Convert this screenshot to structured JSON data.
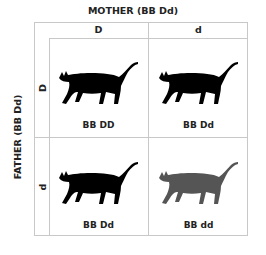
{
  "mother_label": "MOTHER (BB Dd)",
  "father_label": "FATHER (BB Dd)",
  "columns": [
    "D",
    "d"
  ],
  "rows": [
    "D",
    "d"
  ],
  "colors": {
    "dark_cat": "#000000",
    "dilute_cat": "#555555",
    "grid": "#c8c8c8"
  },
  "cells": [
    {
      "genotype": "BB DD",
      "phenotype_icon": "black-cat-icon"
    },
    {
      "genotype": "BB Dd",
      "phenotype_icon": "black-cat-icon"
    },
    {
      "genotype": "BB Dd",
      "phenotype_icon": "black-cat-icon"
    },
    {
      "genotype": "BB dd",
      "phenotype_icon": "grey-cat-icon"
    }
  ]
}
